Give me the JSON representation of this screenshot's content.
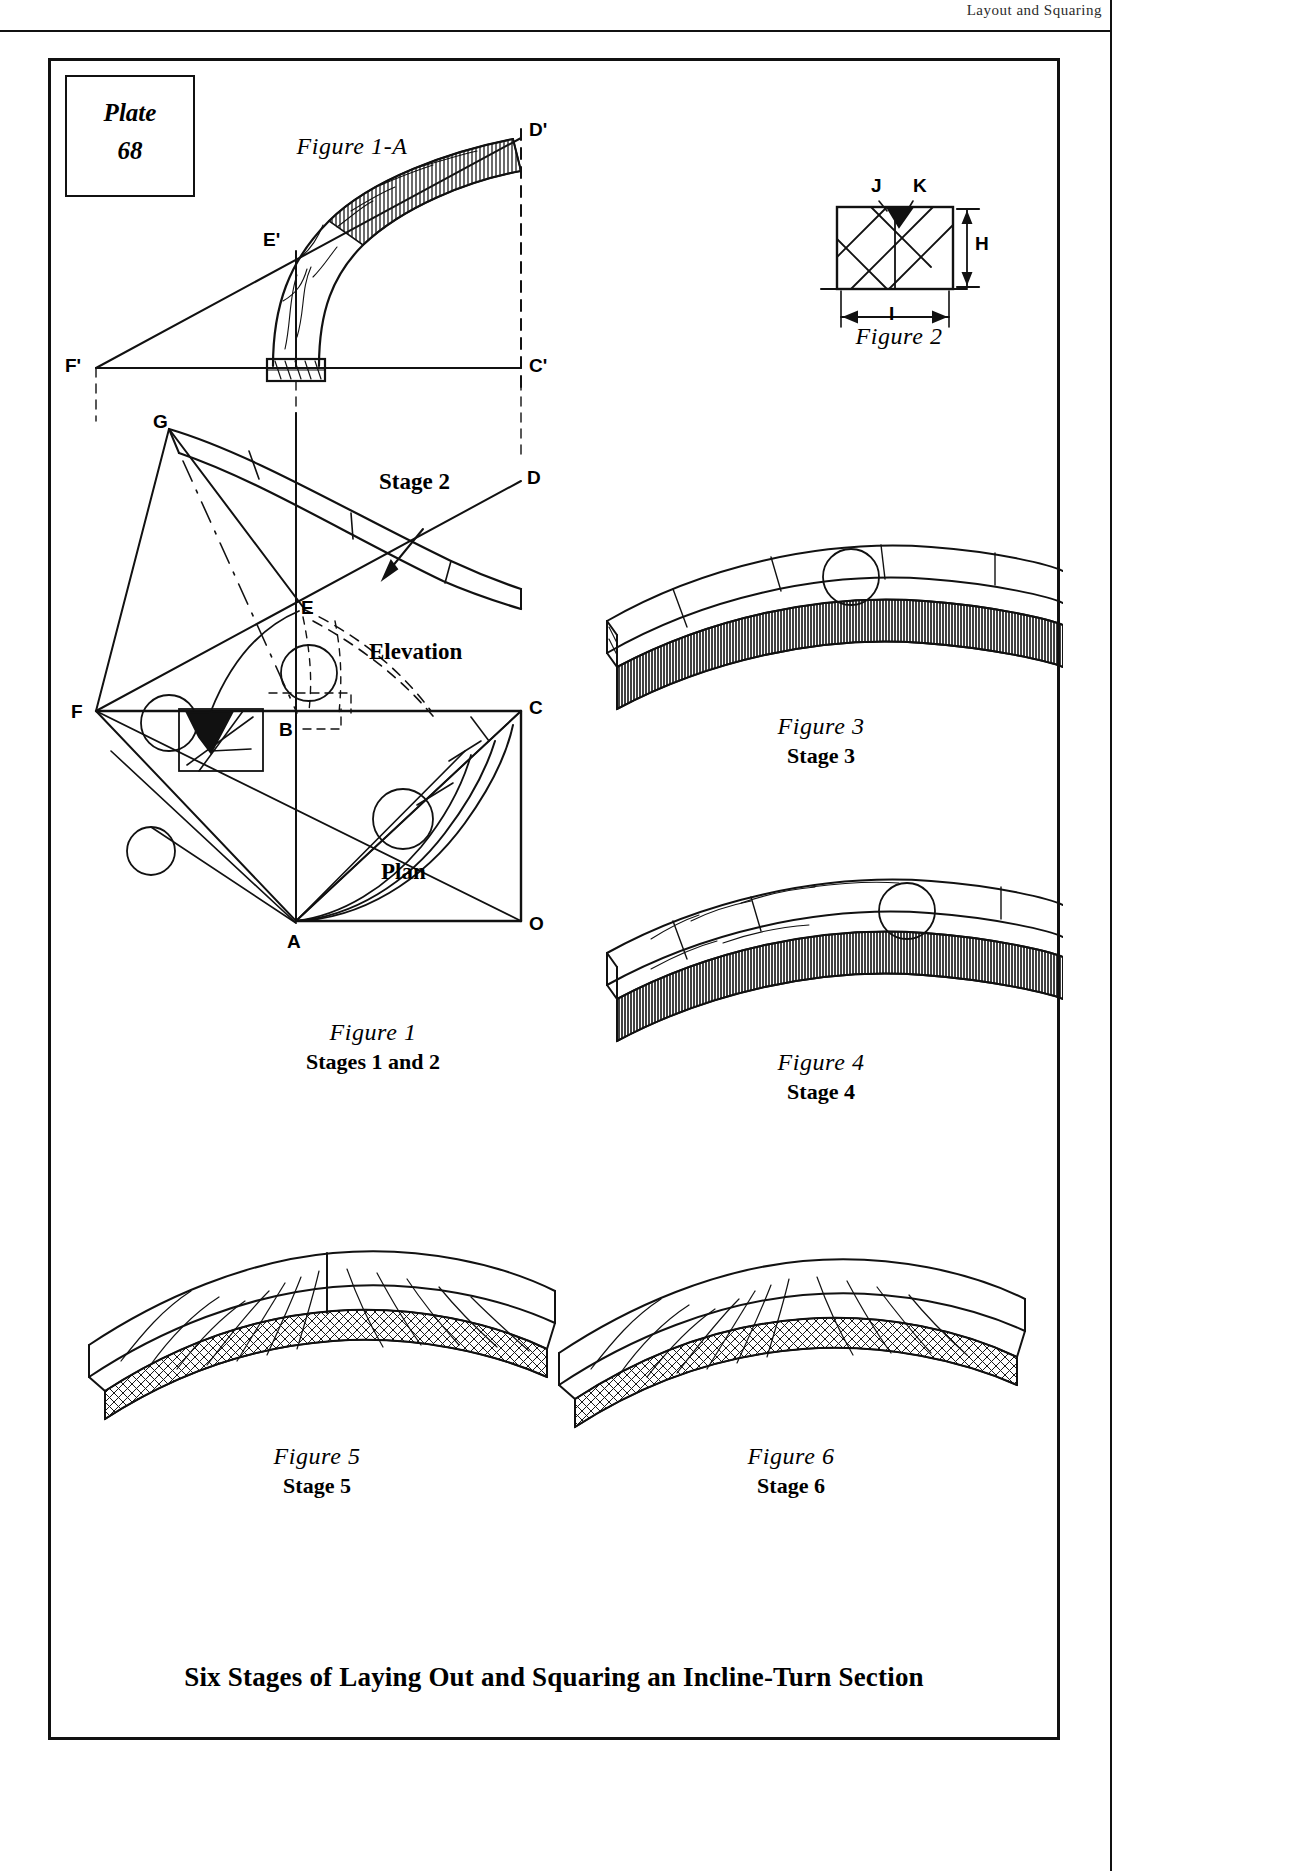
{
  "header": {
    "running_head": "Layout and Squaring"
  },
  "plate": {
    "word": "Plate",
    "number": "68"
  },
  "bottom_title": "Six Stages of Laying Out and Squaring an Incline-Turn Section",
  "figures": [
    {
      "id": "fig1a",
      "title": "Figure 1-A",
      "subtitle": ""
    },
    {
      "id": "fig2",
      "title": "Figure 2",
      "subtitle": ""
    },
    {
      "id": "fig1",
      "title": "Figure  1",
      "subtitle": "Stages 1 and 2"
    },
    {
      "id": "fig3",
      "title": "Figure 3",
      "subtitle": "Stage 3"
    },
    {
      "id": "fig4",
      "title": "Figure 4",
      "subtitle": "Stage 4"
    },
    {
      "id": "fig5",
      "title": "Figure 5",
      "subtitle": "Stage 5"
    },
    {
      "id": "fig6",
      "title": "Figure 6",
      "subtitle": "Stage 6"
    }
  ],
  "view_labels": {
    "elevation": "Elevation",
    "plan": "Plan",
    "stage2_callout": "Stage 2"
  },
  "fig1a_points": {
    "d_prime": "D'",
    "e_prime": "E'",
    "f_prime": "F'",
    "c_prime": "C'"
  },
  "fig1_points": {
    "g": "G",
    "d": "D",
    "e": "E",
    "f": "F",
    "c": "C",
    "b": "B",
    "a": "A",
    "o": "O"
  },
  "fig2_labels": {
    "j": "J",
    "k": "K",
    "h": "H",
    "i": "I"
  },
  "colors": {
    "ink": "#111111",
    "paper": "#ffffff",
    "hatch": "#222222"
  }
}
